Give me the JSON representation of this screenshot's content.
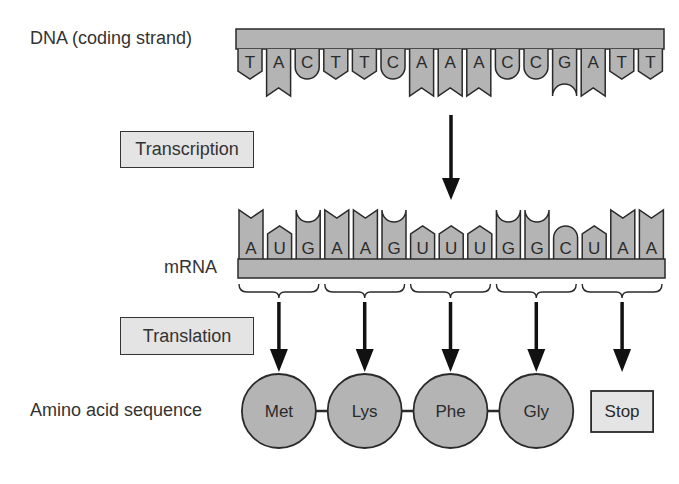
{
  "labels": {
    "dna": "DNA (coding strand)",
    "mrna": "mRNA",
    "amino_acid_sequence": "Amino acid sequence",
    "transcription": "Transcription",
    "translation": "Translation"
  },
  "dna_bases": [
    "T",
    "A",
    "C",
    "T",
    "T",
    "C",
    "A",
    "A",
    "A",
    "C",
    "C",
    "G",
    "A",
    "T",
    "T"
  ],
  "mrna_bases": [
    "A",
    "U",
    "G",
    "A",
    "A",
    "G",
    "U",
    "U",
    "U",
    "G",
    "G",
    "C",
    "U",
    "A",
    "A"
  ],
  "codons": [
    "AUG",
    "AAG",
    "UUU",
    "GGC",
    "UAA"
  ],
  "amino_acids": [
    "Met",
    "Lys",
    "Phe",
    "Gly"
  ],
  "stop_label": "Stop",
  "colors": {
    "fill": "#b4b4b4",
    "box_fill": "#e4e4e4",
    "stroke": "#2a2a2a"
  }
}
